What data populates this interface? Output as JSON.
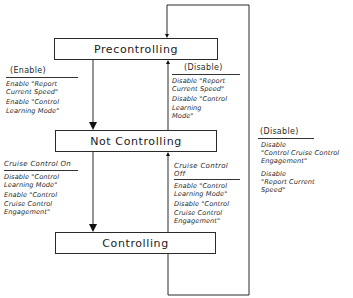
{
  "states": {
    "precontrolling": "Precontrolling",
    "not_controlling": "Not Controlling",
    "controlling": "Controlling"
  },
  "transitions": {
    "pre_to_not": {
      "event": "(Enable)",
      "actions": [
        "Enable \"Report\nCurrent Speed\"",
        "Enable \"Control\nLearning Mode\""
      ]
    },
    "not_to_pre": {
      "event": "(Disable)",
      "actions": [
        "Disable \"Report\nCurrent Speed\"",
        "Disable \"Control\nLearning\nMode\""
      ]
    },
    "not_to_ctrl": {
      "event": "Cruise Control On",
      "actions": [
        "Disable \"Control\nLearning Mode\"",
        "Enable \"Control\nCruise Control\nEngagement\""
      ]
    },
    "ctrl_to_not": {
      "event": "Cruise Control\nOff",
      "actions": [
        "Enable \"Control\nLearning Mode\"",
        "Disable \"Control\nCruise Control\nEngagement\""
      ]
    },
    "ctrl_to_pre": {
      "event": "(Disable)",
      "actions": [
        "Disable\n\"Control Cruise Control\nEngagement\"",
        "Disable\n\"Report Current\nSpeed\""
      ]
    }
  },
  "colors": {
    "line": "#2a2a2a",
    "background": "#ffffff"
  }
}
